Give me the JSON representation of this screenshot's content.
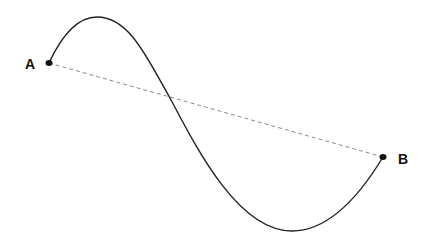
{
  "diagram": {
    "points": [
      {
        "id": "A",
        "label": "A",
        "x": 49,
        "y": 63
      },
      {
        "id": "B",
        "label": "B",
        "x": 383,
        "y": 157
      }
    ],
    "curve": {
      "type": "sinuous-path",
      "peak": {
        "x": 97,
        "y": 17
      },
      "trough": {
        "x": 292,
        "y": 231
      },
      "stroke": "#222222"
    },
    "straight_line": {
      "style": "dashed",
      "stroke": "#888888"
    }
  }
}
